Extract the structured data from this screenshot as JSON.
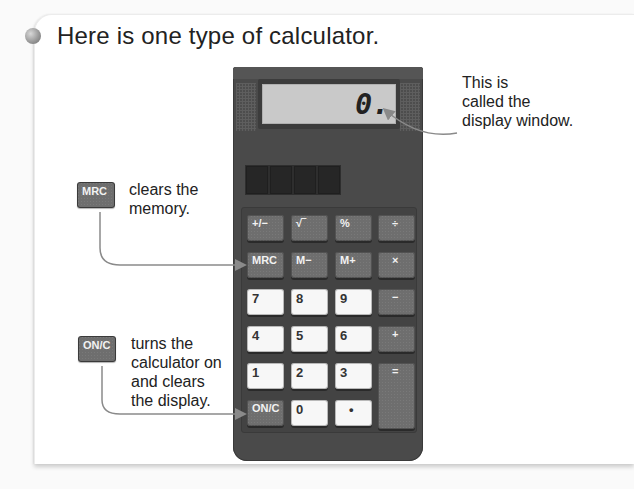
{
  "heading": "Here is one type of calculator.",
  "display": {
    "value": "0.",
    "callout": [
      "This is",
      "called the",
      "display window."
    ]
  },
  "callouts": {
    "mrc": {
      "key_label": "MRC",
      "text": [
        "clears the",
        "memory."
      ]
    },
    "onc": {
      "key_label": "ON/C",
      "text": [
        "turns the",
        "calculator on",
        "and clears",
        "the display."
      ]
    }
  },
  "keys": {
    "row1": [
      "+/−",
      "√‾",
      "%",
      "÷"
    ],
    "row2": [
      "MRC",
      "M−",
      "M+",
      "×"
    ],
    "row3": [
      "7",
      "8",
      "9",
      "−"
    ],
    "row4": [
      "4",
      "5",
      "6",
      "+"
    ],
    "row5": [
      "1",
      "2",
      "3",
      "="
    ],
    "row6": [
      "ON/C",
      "0",
      "•"
    ]
  },
  "colors": {
    "body": "#4a4a4a",
    "dark_key": "#6e6e6e",
    "light_key": "#f7f7f7",
    "display": "#c9c9c9",
    "arrow": "#8a8a8a"
  }
}
